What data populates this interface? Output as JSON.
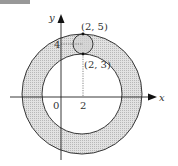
{
  "figure": {
    "axes": {
      "x_label": "x",
      "y_label": "y",
      "origin_label": "0",
      "x_tick_label": "2",
      "y_tick_label": "4"
    },
    "points": [
      {
        "label": "(2, 5)",
        "x": 2,
        "y": 5
      },
      {
        "label": "(2, 3)",
        "x": 2,
        "y": 3
      }
    ],
    "shapes": {
      "outer_circle": {
        "center": [
          2,
          0
        ],
        "radius": 5
      },
      "inner_circle": {
        "center": [
          2,
          0
        ],
        "radius": 3
      },
      "small_circle": {
        "center": [
          2,
          4
        ],
        "radius": 1
      },
      "shaded_region": "annulus between inner and outer circles"
    },
    "colors": {
      "shade": "#d4d4d4",
      "stroke": "#222222",
      "background": "#ffffff"
    }
  }
}
